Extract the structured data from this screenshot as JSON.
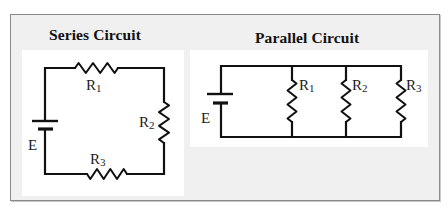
{
  "diagram": {
    "series": {
      "title": "Series Circuit",
      "source_label": "E",
      "resistors": [
        {
          "name": "R",
          "sub": "1",
          "position": "top"
        },
        {
          "name": "R",
          "sub": "2",
          "position": "right"
        },
        {
          "name": "R",
          "sub": "3",
          "position": "bottom"
        }
      ]
    },
    "parallel": {
      "title": "Parallel Circuit",
      "source_label": "E",
      "resistors": [
        {
          "name": "R",
          "sub": "1",
          "position": "branch-1"
        },
        {
          "name": "R",
          "sub": "2",
          "position": "branch-2"
        },
        {
          "name": "R",
          "sub": "3",
          "position": "branch-3"
        }
      ]
    },
    "colors": {
      "frame_bg": "#f0f0f0",
      "panel_bg": "#ffffff",
      "wire": "#111111",
      "border": "#8a8a8a"
    }
  }
}
